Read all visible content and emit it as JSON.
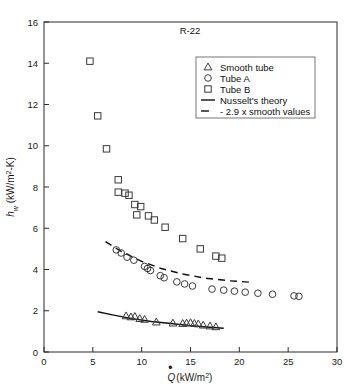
{
  "chart_data": {
    "type": "scatter",
    "title": "R-22",
    "xlabel": "Q̇ (kW/m²)",
    "ylabel": "h_w (kW/m²-K)",
    "xlim": [
      0,
      30
    ],
    "ylim": [
      0,
      16
    ],
    "xticks": [
      0,
      5,
      10,
      15,
      20,
      25,
      30
    ],
    "yticks": [
      0,
      2,
      4,
      6,
      8,
      10,
      12,
      14,
      16
    ],
    "grid": false,
    "legend_position": "upper-right",
    "series": [
      {
        "name": "Smooth tube",
        "marker": "triangle",
        "points": [
          [
            8.4,
            1.75
          ],
          [
            8.9,
            1.7
          ],
          [
            9.3,
            1.72
          ],
          [
            9.8,
            1.62
          ],
          [
            10.3,
            1.58
          ],
          [
            11.5,
            1.45
          ],
          [
            13.2,
            1.4
          ],
          [
            14.2,
            1.38
          ],
          [
            14.6,
            1.4
          ],
          [
            15.0,
            1.42
          ],
          [
            15.4,
            1.38
          ],
          [
            15.8,
            1.36
          ],
          [
            16.3,
            1.3
          ],
          [
            17.0,
            1.26
          ],
          [
            17.6,
            1.22
          ]
        ]
      },
      {
        "name": "Tube A",
        "marker": "circle",
        "points": [
          [
            7.4,
            4.95
          ],
          [
            7.9,
            4.8
          ],
          [
            8.5,
            4.6
          ],
          [
            9.2,
            4.45
          ],
          [
            10.3,
            4.15
          ],
          [
            10.6,
            4.05
          ],
          [
            10.9,
            3.95
          ],
          [
            11.9,
            3.7
          ],
          [
            12.3,
            3.6
          ],
          [
            13.6,
            3.4
          ],
          [
            14.4,
            3.3
          ],
          [
            15.2,
            3.2
          ],
          [
            17.2,
            3.05
          ],
          [
            18.4,
            3.0
          ],
          [
            19.5,
            2.95
          ],
          [
            20.6,
            2.9
          ],
          [
            21.9,
            2.85
          ],
          [
            23.4,
            2.8
          ],
          [
            25.6,
            2.72
          ],
          [
            26.1,
            2.7
          ]
        ]
      },
      {
        "name": "Tube B",
        "marker": "square",
        "points": [
          [
            4.7,
            14.1
          ],
          [
            5.5,
            11.45
          ],
          [
            6.4,
            9.85
          ],
          [
            7.6,
            8.35
          ],
          [
            7.6,
            7.75
          ],
          [
            8.3,
            7.7
          ],
          [
            8.7,
            7.6
          ],
          [
            9.3,
            7.15
          ],
          [
            9.9,
            7.05
          ],
          [
            9.5,
            6.65
          ],
          [
            10.7,
            6.6
          ],
          [
            11.3,
            6.4
          ],
          [
            12.4,
            6.05
          ],
          [
            14.2,
            5.5
          ],
          [
            16.0,
            5.0
          ],
          [
            17.6,
            4.65
          ],
          [
            18.2,
            4.55
          ]
        ]
      }
    ],
    "lines": [
      {
        "name": "Nusselt's theory",
        "style": "solid",
        "points": [
          [
            5.5,
            1.95
          ],
          [
            7.0,
            1.8
          ],
          [
            9.0,
            1.62
          ],
          [
            11.0,
            1.48
          ],
          [
            13.0,
            1.38
          ],
          [
            15.0,
            1.28
          ],
          [
            17.0,
            1.2
          ],
          [
            18.4,
            1.15
          ]
        ]
      },
      {
        "name": "2.9 x smooth values",
        "style": "dashed",
        "points": [
          [
            6.3,
            5.35
          ],
          [
            8.0,
            4.85
          ],
          [
            10.0,
            4.4
          ],
          [
            12.0,
            4.05
          ],
          [
            14.0,
            3.8
          ],
          [
            16.5,
            3.58
          ],
          [
            19.0,
            3.45
          ],
          [
            21.3,
            3.38
          ]
        ]
      }
    ],
    "legend": [
      {
        "label": "Smooth tube",
        "marker": "triangle"
      },
      {
        "label": "Tube A",
        "marker": "circle"
      },
      {
        "label": "Tube B",
        "marker": "square"
      },
      {
        "label": "Nusselt's theory",
        "marker": "line-solid"
      },
      {
        "label": "- 2.9 x smooth values",
        "marker": "line-dashed"
      }
    ]
  }
}
